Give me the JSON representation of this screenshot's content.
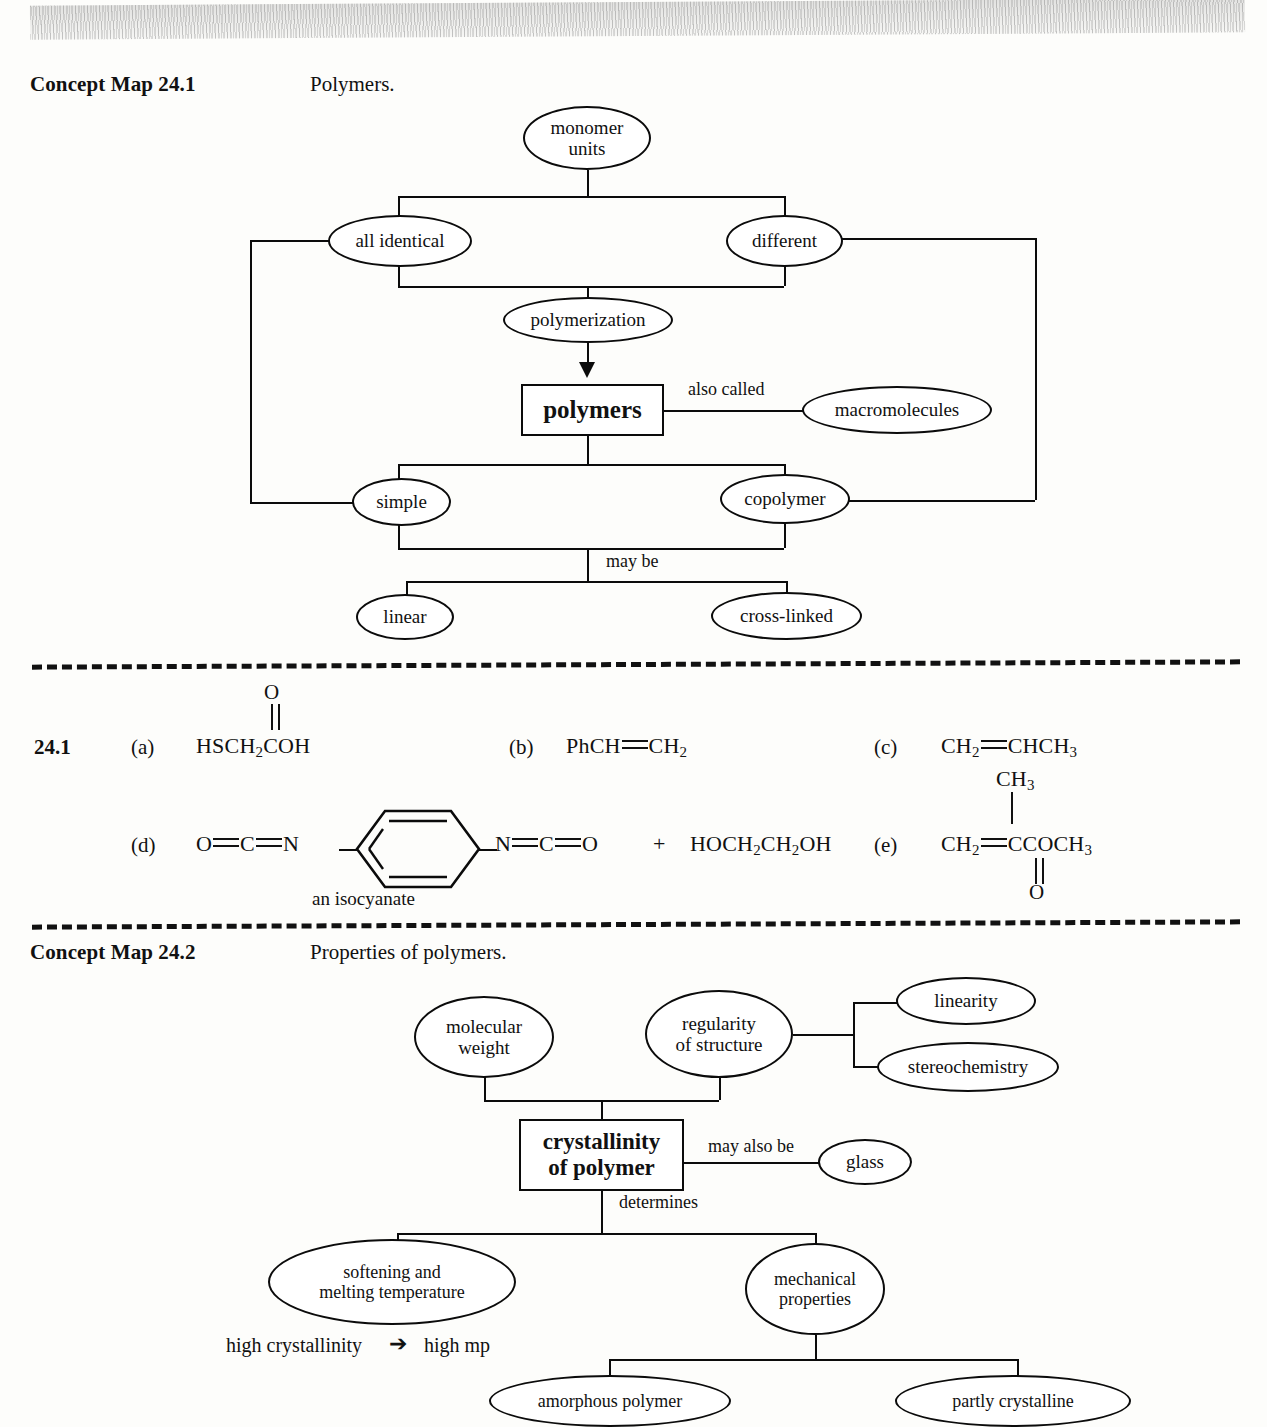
{
  "page": {
    "concept_map_1": {
      "heading": "Concept Map 24.1",
      "title": "Polymers.",
      "nodes": {
        "monomer_units": "monomer\nunits",
        "all_identical": "all  identical",
        "different": "different",
        "polymerization": "polymerization",
        "polymers": "polymers",
        "macromolecules": "macromolecules",
        "simple": "simple",
        "copolymer": "copolymer",
        "linear": "linear",
        "cross_linked": "cross-linked"
      },
      "edge_labels": {
        "also_called": "also called",
        "may_be": "may be"
      }
    },
    "problem": {
      "number": "24.1",
      "items": {
        "a": {
          "label": "(a)",
          "formula_top": "O",
          "formula": "HSCH2COH",
          "parts": [
            "HSCH",
            "2",
            "COH"
          ]
        },
        "b": {
          "label": "(b)",
          "left": "PhCH",
          "right": "CH2",
          "right_sub": "2"
        },
        "c": {
          "label": "(c)",
          "left": "CH2",
          "left_sub": "2",
          "right": "CHCH3",
          "right_sub": "3"
        },
        "d": {
          "label": "(d)",
          "left_chain": "O=C=N",
          "right_chain": "N=C=O",
          "plus": "+",
          "diol": "HOCH2CH2OH",
          "caption": "an isocyanate"
        },
        "e": {
          "label": "(e)",
          "methyl_top": "CH3",
          "left": "CH2",
          "center_right": "CCOCH3",
          "carbonyl_o": "O"
        }
      }
    },
    "concept_map_2": {
      "heading": "Concept Map 24.2",
      "title": "Properties of polymers.",
      "nodes": {
        "molecular_weight": "molecular\nweight",
        "regularity": "regularity\nof structure",
        "linearity": "linearity",
        "stereochemistry": "stereochemistry",
        "crystallinity": "crystallinity\nof polymer",
        "glass": "glass",
        "softening": "softening and\nmelting temperature",
        "mechanical": "mechanical\nproperties",
        "amorphous": "amorphous polymer",
        "partly_crystalline": "partly  crystalline"
      },
      "edge_labels": {
        "may_also_be": "may also be",
        "determines": "determines"
      },
      "annotation": {
        "left": "high  crystallinity",
        "arrow": "➔",
        "right": "high mp"
      }
    }
  },
  "colors": {
    "ink": "#0b0b0b",
    "paper": "#fdfdfb"
  }
}
